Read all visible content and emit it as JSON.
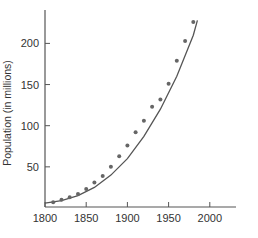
{
  "chart_data": {
    "type": "scatter",
    "title": "",
    "xlabel": "",
    "ylabel": "Population (in millions)",
    "xlim": [
      1800,
      2010
    ],
    "ylim": [
      0,
      235
    ],
    "x_ticks": [
      1800,
      1850,
      1900,
      1950,
      2000
    ],
    "y_ticks": [
      50,
      100,
      150,
      200
    ],
    "grid": false,
    "legend": null,
    "series": [
      {
        "name": "Observed population",
        "kind": "points",
        "x": [
          1810,
          1820,
          1830,
          1840,
          1850,
          1860,
          1870,
          1880,
          1890,
          1900,
          1910,
          1920,
          1930,
          1940,
          1950,
          1960,
          1970,
          1980
        ],
        "y": [
          7,
          10,
          13,
          17,
          23,
          31,
          39,
          50,
          63,
          76,
          92,
          106,
          123,
          132,
          151,
          179,
          203,
          226
        ]
      },
      {
        "name": "Fitted curve",
        "kind": "line",
        "x": [
          1800,
          1820,
          1840,
          1860,
          1880,
          1900,
          1920,
          1940,
          1960,
          1980,
          1985
        ],
        "y": [
          6,
          9,
          15,
          25,
          40,
          60,
          87,
          120,
          160,
          210,
          228
        ]
      }
    ]
  },
  "axes": {
    "y_label": "Population (in millions)",
    "y_tick_labels": [
      "200",
      "150",
      "100",
      "50"
    ],
    "x_tick_labels": [
      "1800",
      "1850",
      "1900",
      "1950",
      "2000"
    ]
  }
}
